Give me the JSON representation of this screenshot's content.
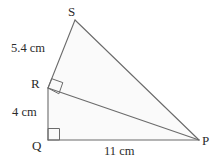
{
  "figure": {
    "kind": "geometry-diagram",
    "colors": {
      "stroke": "#6b6b6b",
      "fill": "#fafafa",
      "text": "#2b2b2b",
      "background": "#ffffff"
    },
    "vertices": [
      {
        "name": "S",
        "label": "S",
        "x": 75,
        "y": 20
      },
      {
        "name": "R",
        "label": "R",
        "x": 48,
        "y": 88
      },
      {
        "name": "Q",
        "label": "Q",
        "x": 48,
        "y": 140
      },
      {
        "name": "P",
        "label": "P",
        "x": 199,
        "y": 140
      }
    ],
    "segments": [
      {
        "name": "segment-SR",
        "from": "S",
        "to": "R"
      },
      {
        "name": "segment-SP",
        "from": "S",
        "to": "P"
      },
      {
        "name": "segment-RP",
        "from": "R",
        "to": "P"
      },
      {
        "name": "segment-RQ",
        "from": "R",
        "to": "Q"
      },
      {
        "name": "segment-QP",
        "from": "Q",
        "to": "P"
      }
    ],
    "measurements": [
      {
        "name": "length-SR",
        "side": "SR",
        "value": "5.4 cm"
      },
      {
        "name": "length-RQ",
        "side": "RQ",
        "value": "4 cm"
      },
      {
        "name": "length-QP",
        "side": "QP",
        "value": "11 cm"
      }
    ],
    "right_angles": [
      {
        "name": "right-angle-R",
        "at": "R",
        "between": "SR and RP"
      },
      {
        "name": "right-angle-Q",
        "at": "Q",
        "between": "RQ and QP"
      }
    ]
  }
}
